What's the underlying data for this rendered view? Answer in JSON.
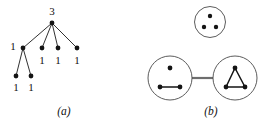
{
  "figure": {
    "width": 267,
    "height": 123,
    "background": "#ffffff",
    "ink_color": "#141414",
    "circle_color": "#4a4a4a",
    "link_color": "#6e6e6e"
  },
  "panel_a": {
    "caption": "(a)",
    "caption_x": 64,
    "caption_y": 115,
    "type": "weighted-tree",
    "nodes": [
      {
        "id": "root",
        "x": 52,
        "y": 23,
        "r": 2.4,
        "label": "3",
        "label_x": 52,
        "label_y": 15
      },
      {
        "id": "c1",
        "x": 23,
        "y": 48,
        "r": 2.4,
        "label": "1",
        "label_x": 13,
        "label_y": 50
      },
      {
        "id": "c2",
        "x": 42,
        "y": 48,
        "r": 2.4,
        "label": "1",
        "label_x": 42,
        "label_y": 64
      },
      {
        "id": "c3",
        "x": 58,
        "y": 48,
        "r": 2.4,
        "label": "1",
        "label_x": 58,
        "label_y": 64
      },
      {
        "id": "c4",
        "x": 77,
        "y": 48,
        "r": 2.4,
        "label": "1",
        "label_x": 77,
        "label_y": 64
      },
      {
        "id": "g1",
        "x": 16,
        "y": 76,
        "r": 2.4,
        "label": "1",
        "label_x": 16,
        "label_y": 91
      },
      {
        "id": "g2",
        "x": 31,
        "y": 76,
        "r": 2.4,
        "label": "1",
        "label_x": 31,
        "label_y": 91
      }
    ],
    "edges": [
      {
        "from": "root",
        "to": "c1"
      },
      {
        "from": "root",
        "to": "c2"
      },
      {
        "from": "root",
        "to": "c3"
      },
      {
        "from": "root",
        "to": "c4"
      },
      {
        "from": "c1",
        "to": "g1"
      },
      {
        "from": "c1",
        "to": "g2"
      }
    ]
  },
  "panel_b": {
    "caption": "(b)",
    "caption_x": 211,
    "caption_y": 115,
    "type": "cluster-graph",
    "clusters": [
      {
        "id": "top-cluster",
        "cx": 210,
        "cy": 22,
        "r": 15.5,
        "nodes": [
          {
            "id": "t1",
            "x": 210,
            "y": 16,
            "r": 2.2
          },
          {
            "id": "t2",
            "x": 204,
            "y": 27,
            "r": 2.2
          },
          {
            "id": "t3",
            "x": 216,
            "y": 27,
            "r": 2.2
          }
        ],
        "edges": []
      },
      {
        "id": "left-cluster",
        "cx": 170,
        "cy": 78,
        "r": 22,
        "nodes": [
          {
            "id": "l1",
            "x": 170,
            "y": 68,
            "r": 2.4
          },
          {
            "id": "l2",
            "x": 160,
            "y": 87,
            "r": 2.4
          },
          {
            "id": "l3",
            "x": 180,
            "y": 87,
            "r": 2.4
          }
        ],
        "edges": [
          {
            "from": "l2",
            "to": "l3"
          }
        ]
      },
      {
        "id": "right-cluster",
        "cx": 235,
        "cy": 78,
        "r": 22,
        "nodes": [
          {
            "id": "r1",
            "x": 235,
            "y": 68,
            "r": 2.4
          },
          {
            "id": "r2",
            "x": 226,
            "y": 87,
            "r": 2.4
          },
          {
            "id": "r3",
            "x": 245,
            "y": 87,
            "r": 2.4
          }
        ],
        "edges": [
          {
            "from": "r1",
            "to": "r2"
          },
          {
            "from": "r2",
            "to": "r3"
          },
          {
            "from": "r3",
            "to": "r1"
          }
        ]
      }
    ],
    "links": [
      {
        "from": "left-cluster",
        "to": "right-cluster",
        "x1": 192,
        "y1": 78,
        "x2": 213,
        "y2": 78
      }
    ]
  }
}
